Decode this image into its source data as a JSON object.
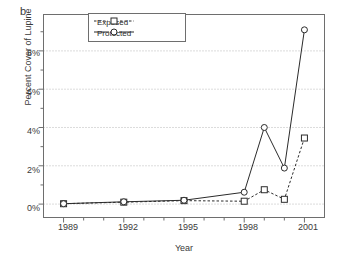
{
  "figure": {
    "panel_label": "b",
    "ylabel": "Percent Cover of Lupine",
    "xlabel": "Year"
  },
  "legend": {
    "entries": [
      {
        "label": "Exposed",
        "style": "dashed-square",
        "color": "#2b2b2b"
      },
      {
        "label": "Protected",
        "style": "solid-circle",
        "color": "#2b2b2b"
      }
    ]
  },
  "axes": {
    "y_ticks": [
      "0%",
      "2%",
      "4%",
      "6%",
      "8%"
    ],
    "x_ticks": [
      "1989",
      "1992",
      "1995",
      "1998",
      "2001"
    ]
  },
  "chart_data": {
    "type": "line",
    "title": "",
    "xlabel": "Year",
    "ylabel": "Percent Cover of Lupine",
    "x": [
      1989,
      1992,
      1995,
      1998,
      1999,
      2000,
      2001
    ],
    "xlim": [
      1988,
      2002
    ],
    "ylim": [
      -0.7,
      9.9
    ],
    "yticks": [
      0,
      2,
      4,
      6,
      8
    ],
    "ytick_labels": [
      "0%",
      "2%",
      "4%",
      "6%",
      "8%"
    ],
    "xticks": [
      1989,
      1992,
      1995,
      1998,
      2001
    ],
    "xtick_labels": [
      "1989",
      "1992",
      "1995",
      "1998",
      "2001"
    ],
    "grid": "horizontal-dotted",
    "legend_position": "top-center",
    "series": [
      {
        "name": "Exposed",
        "marker": "open-square",
        "line": "dashed",
        "values": [
          0.02,
          0.1,
          0.18,
          0.15,
          0.75,
          0.25,
          3.45
        ]
      },
      {
        "name": "Protected",
        "marker": "open-circle",
        "line": "solid",
        "values": [
          0.02,
          0.12,
          0.2,
          0.62,
          4.0,
          1.88,
          9.1
        ]
      }
    ]
  }
}
